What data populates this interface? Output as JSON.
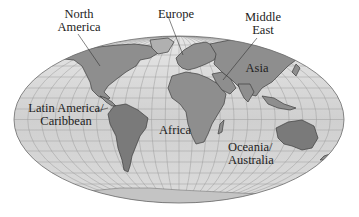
{
  "map": {
    "projection": "Mollweide (equal-area, elliptical)",
    "style": "grayscale shaded relief with graticule",
    "colors": {
      "ocean": "#d4d4d4",
      "land": "#8f8f8f",
      "land_dark": "#6e6e6e",
      "graticule": "#9a9a9a",
      "outline": "#6a6a6a",
      "text": "#222222",
      "leader": "#333333"
    },
    "regions": [
      {
        "id": "north-america",
        "lines": [
          "North",
          "America"
        ]
      },
      {
        "id": "europe",
        "lines": [
          "Europe"
        ]
      },
      {
        "id": "middle-east",
        "lines": [
          "Middle",
          "East"
        ]
      },
      {
        "id": "asia",
        "lines": [
          "Asia"
        ]
      },
      {
        "id": "latin-america",
        "lines": [
          "Latin America/",
          "Caribbean"
        ]
      },
      {
        "id": "africa",
        "lines": [
          "Africa"
        ]
      },
      {
        "id": "oceania",
        "lines": [
          "Oceania/",
          "Australia"
        ]
      }
    ]
  }
}
